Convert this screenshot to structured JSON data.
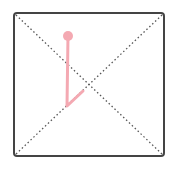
{
  "canvas": {
    "width": 172,
    "height": 170,
    "background": "#ffffff"
  },
  "frame": {
    "x": 14,
    "y": 13,
    "width": 150,
    "height": 143,
    "radius": 3,
    "stroke": "#444444",
    "stroke_width": 2
  },
  "diagonals": {
    "stroke": "#555555",
    "dash": "1.5 2.5",
    "stroke_width": 1.3
  },
  "pen_stroke": {
    "color": "#f4a9b2",
    "width": 3,
    "start_dot": {
      "cx": 68,
      "cy": 36,
      "r": 5
    },
    "points": [
      [
        68,
        36
      ],
      [
        67,
        106
      ],
      [
        83,
        91
      ]
    ]
  }
}
